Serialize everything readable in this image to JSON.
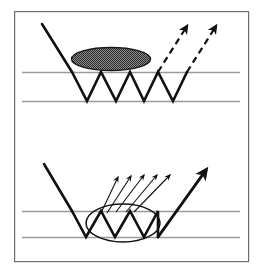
{
  "figure": {
    "type": "schematic-diagram",
    "canvas": {
      "width": 262,
      "height": 277
    },
    "border": {
      "name": "figure-frame",
      "x": 14,
      "y": 11,
      "width": 234,
      "height": 250,
      "stroke": "#6e6e6e",
      "stroke_width": 1.2,
      "fill": "#ffffff"
    },
    "colors": {
      "ray_stroke": "#111111",
      "guide_line": "#9a9a9a",
      "frame": "#6e6e6e",
      "ellipse_fill_dark": "#7d7d7d",
      "ellipse_fill_light": "#d9d9d9",
      "ellipse_outline": "#111111",
      "background": "#ffffff"
    },
    "panels": [
      {
        "name": "top-panel",
        "label": "",
        "slab": {
          "name": "waveguide-slab-top",
          "top_line_y": 72,
          "bottom_line_y": 101,
          "x_start": 22,
          "x_end": 240,
          "stroke": "#9a9a9a",
          "stroke_width": 1.6
        },
        "incoming_ray": {
          "name": "incoming-ray-top",
          "x1": 42,
          "y1": 24,
          "x2": 72,
          "y2": 72,
          "style": "solid",
          "stroke_width": 2.6,
          "arrowhead": false
        },
        "zigzag": {
          "name": "guided-zigzag-top",
          "style": "solid",
          "stroke_width": 2.6,
          "points": [
            [
              72,
              72
            ],
            [
              87,
              101
            ],
            [
              101,
              72
            ],
            [
              116,
              101
            ],
            [
              130,
              72
            ],
            [
              144,
              101
            ],
            [
              158,
              72
            ],
            [
              173,
              101
            ],
            [
              187,
              72
            ]
          ]
        },
        "scatterer": {
          "name": "scattering-region-dark-ellipse",
          "cx": 111,
          "cy": 59,
          "rx": 39.5,
          "ry": 11.5,
          "fill": "hatched-dark",
          "outline": "#1a1a1a",
          "outline_width": 1.4
        },
        "outgoing_rays": [
          {
            "name": "outgoing-ray-top-1",
            "x1": 158,
            "y1": 72,
            "x2": 187,
            "y2": 26,
            "style": "dashed",
            "stroke_width": 2.2,
            "arrowhead": true
          },
          {
            "name": "outgoing-ray-top-2",
            "x1": 187,
            "y1": 72,
            "x2": 216,
            "y2": 26,
            "style": "dashed",
            "stroke_width": 2.2,
            "arrowhead": true
          }
        ]
      },
      {
        "name": "bottom-panel",
        "label": "",
        "slab": {
          "name": "waveguide-slab-bottom",
          "top_line_y": 211,
          "bottom_line_y": 237,
          "x_start": 22,
          "x_end": 240,
          "stroke": "#9a9a9a",
          "stroke_width": 1.6
        },
        "incoming_ray": {
          "name": "incoming-ray-bottom",
          "x1": 44,
          "y1": 164,
          "x2": 72,
          "y2": 211,
          "style": "solid",
          "stroke_width": 2.6,
          "arrowhead": false
        },
        "zigzag": {
          "name": "guided-zigzag-bottom",
          "style": "solid",
          "stroke_width": 2.6,
          "points": [
            [
              72,
              211
            ],
            [
              86,
              237
            ],
            [
              101,
              211
            ],
            [
              115,
              237
            ],
            [
              130,
              211
            ],
            [
              144,
              237
            ],
            [
              158,
              211
            ],
            [
              158,
              237
            ]
          ]
        },
        "scatterer": {
          "name": "scattering-region-open-ellipse",
          "cx": 123,
          "cy": 223,
          "rx": 37,
          "ry": 19,
          "fill": "none",
          "outline": "#111111",
          "outline_width": 1.5
        },
        "thick_outgoing_ray": {
          "name": "outgoing-ray-bottom-specular",
          "x1": 158,
          "y1": 237,
          "x2": 206,
          "y2": 170,
          "style": "solid",
          "stroke_width": 3.0,
          "arrowhead": true
        },
        "diffuse_rays": [
          {
            "name": "diffuse-ray-1",
            "x1": 101,
            "y1": 213,
            "x2": 118,
            "y2": 177,
            "stroke_width": 1.1,
            "arrowhead": true
          },
          {
            "name": "diffuse-ray-2",
            "x1": 107,
            "y1": 213,
            "x2": 131,
            "y2": 176,
            "stroke_width": 1.1,
            "arrowhead": true
          },
          {
            "name": "diffuse-ray-3",
            "x1": 116,
            "y1": 212,
            "x2": 144,
            "y2": 175,
            "stroke_width": 1.1,
            "arrowhead": true
          },
          {
            "name": "diffuse-ray-4",
            "x1": 126,
            "y1": 212,
            "x2": 157,
            "y2": 175,
            "stroke_width": 1.1,
            "arrowhead": true
          },
          {
            "name": "diffuse-ray-5",
            "x1": 134,
            "y1": 212,
            "x2": 170,
            "y2": 175,
            "stroke_width": 1.1,
            "arrowhead": true
          }
        ]
      }
    ]
  }
}
